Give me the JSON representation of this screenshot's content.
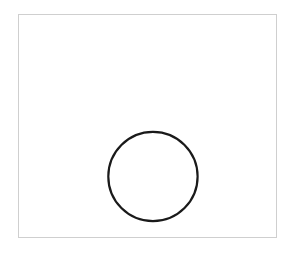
{
  "canvas": {
    "width": 290,
    "height": 254,
    "background_color": "#ffffff"
  },
  "frame": {
    "name": "figure-border",
    "x": 18,
    "y": 14,
    "width": 259,
    "height": 224,
    "stroke_color": "#cfcfcf",
    "stroke_width": 1,
    "fill_color": "#ffffff"
  },
  "shapes": [
    {
      "type": "circle",
      "name": "circle-outline",
      "center_x": 153,
      "center_y": 177,
      "radius": 45,
      "diameter": 90,
      "stroke_color": "#1a1a1a",
      "stroke_width": 2.2,
      "fill": "none",
      "style": "hand-drawn"
    }
  ],
  "labels": {
    "title": "",
    "caption": "",
    "annotations": []
  },
  "accessibility": {
    "description": "A single black circle outline drawn in the lower-center of a thin light-gray rectangular frame on a white background."
  }
}
